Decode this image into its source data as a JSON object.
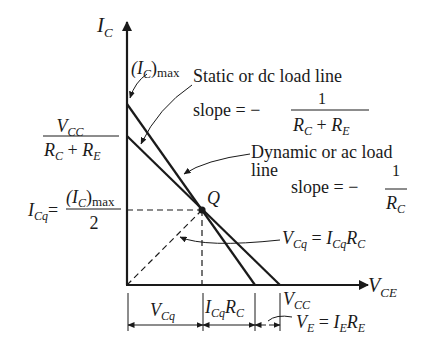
{
  "diagram": {
    "axes": {
      "y_label_main": "I",
      "y_label_sub": "C",
      "x_label_main": "V",
      "x_label_sub": "CE"
    },
    "labels": {
      "ic_max_main": "(I",
      "ic_max_sub": "C",
      "ic_max_tail": ")",
      "ic_max_max": "max",
      "dc_title": "Static or dc load line",
      "dc_slope_word": "slope = −",
      "dc_slope_num": "1",
      "dc_slope_den_r1": "R",
      "dc_slope_den_s1": "C",
      "dc_slope_den_plus": " + ",
      "dc_slope_den_r2": "R",
      "dc_slope_den_s2": "E",
      "ac_title_1": "Dynamic or ac load",
      "ac_title_2": "line",
      "ac_slope_word": "slope = −",
      "ac_slope_num": "1",
      "ac_slope_den_r": "R",
      "ac_slope_den_s": "C",
      "vcc_frac_num_v": "V",
      "vcc_frac_num_s": "CC",
      "vcc_frac_den_r1": "R",
      "vcc_frac_den_s1": "C",
      "vcc_frac_den_plus": " + ",
      "vcc_frac_den_r2": "R",
      "vcc_frac_den_s2": "E",
      "icq_i": "I",
      "icq_s": "Cq",
      "icq_eq": "=",
      "icq_num_main": "(I",
      "icq_num_sub": "C",
      "icq_num_tail": ")",
      "icq_num_max": "max",
      "icq_den": "2",
      "q_point": "Q",
      "vcq_eq_v": "V",
      "vcq_eq_vs": "Cq",
      "vcq_eq_eq": " = ",
      "vcq_eq_i": "I",
      "vcq_eq_is": "Cq",
      "vcq_eq_r": "R",
      "vcq_eq_rs": "C",
      "dim_vcq_v": "V",
      "dim_vcq_s": "Cq",
      "dim_icqrc_i": "I",
      "dim_icqrc_is": "Cq",
      "dim_icqrc_r": "R",
      "dim_icqrc_rs": "C",
      "dim_vcc_v": "V",
      "dim_vcc_s": "CC",
      "ve_v": "V",
      "ve_vs": "E",
      "ve_eq": " = ",
      "ve_i": "I",
      "ve_is": "E",
      "ve_r": "R",
      "ve_rs": "E"
    }
  }
}
